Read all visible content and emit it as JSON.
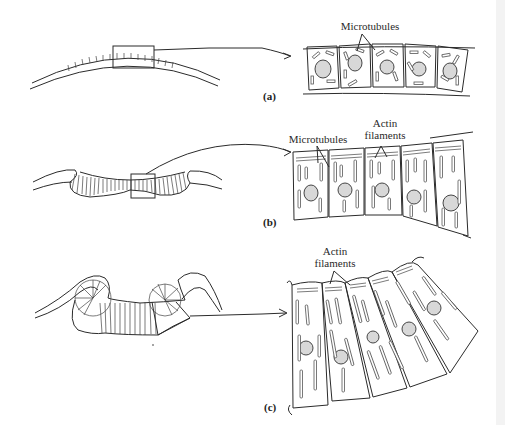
{
  "diagram": {
    "title": "",
    "panels": [
      {
        "id": "a",
        "label": "(a)",
        "annotations": [
          "Microtubules"
        ],
        "description": "Flat neural plate; cuboidal cells with scattered microtubules"
      },
      {
        "id": "b",
        "label": "(b)",
        "annotations": [
          "Microtubules",
          "Actin filaments"
        ],
        "description": "Elongating columnar cells; microtubules aligned along long axis, actin filaments at apical surface"
      },
      {
        "id": "c",
        "label": "(c)",
        "annotations": [
          "Actin filaments"
        ],
        "description": "Neural folds curling; wedge-shaped cells with apical constriction"
      }
    ],
    "colors": {
      "line": "#2b2b2b",
      "nucleus_fill": "#d8d8d8",
      "background": "#ffffff"
    }
  }
}
